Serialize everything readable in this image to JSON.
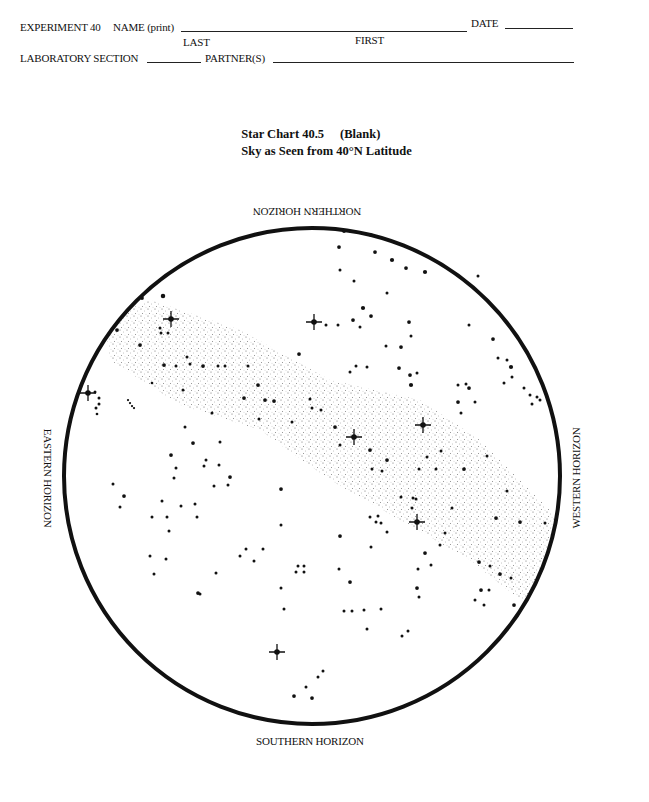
{
  "form": {
    "experiment_label": "EXPERIMENT 40",
    "name_label": "NAME (print)",
    "last_label": "LAST",
    "first_label": "FIRST",
    "date_label": "DATE",
    "section_label": "LABORATORY SECTION",
    "partners_label": "PARTNER(S)",
    "name_value": "",
    "date_value": "",
    "section_value": "",
    "partners_value": ""
  },
  "title": {
    "line1_a": "Star Chart 40.5",
    "line1_b": "(Blank)",
    "line2": "Sky as Seen from 40°N Latitude"
  },
  "horizons": {
    "north": "NORTHERN HORIZON",
    "south": "SOUTHERN HORIZON",
    "east": "EASTERN HORIZON",
    "west": "WESTERN HORIZON"
  },
  "chart": {
    "circle": {
      "cx": 312,
      "cy": 476,
      "r": 248,
      "stroke": "#111111",
      "stroke_width": 4
    },
    "milky_way": {
      "color": "#555555",
      "band": [
        [
          105,
          320
        ],
        [
          150,
          300
        ],
        [
          240,
          330
        ],
        [
          330,
          380
        ],
        [
          420,
          400
        ],
        [
          480,
          440
        ],
        [
          545,
          505
        ],
        [
          560,
          520
        ],
        [
          558,
          580
        ],
        [
          520,
          600
        ],
        [
          470,
          560
        ],
        [
          400,
          520
        ],
        [
          330,
          480
        ],
        [
          260,
          430
        ],
        [
          180,
          405
        ],
        [
          110,
          360
        ]
      ]
    },
    "bright_stars": [
      {
        "x": 171,
        "y": 319
      },
      {
        "x": 88,
        "y": 393
      },
      {
        "x": 314,
        "y": 322
      },
      {
        "x": 354,
        "y": 437
      },
      {
        "x": 423,
        "y": 425
      },
      {
        "x": 417,
        "y": 522
      },
      {
        "x": 277,
        "y": 652
      }
    ],
    "stars": [
      {
        "x": 163,
        "y": 296,
        "s": 3
      },
      {
        "x": 142,
        "y": 298,
        "s": 2.5
      },
      {
        "x": 117,
        "y": 330,
        "s": 2.5
      },
      {
        "x": 160,
        "y": 328,
        "s": 2
      },
      {
        "x": 168,
        "y": 333,
        "s": 2
      },
      {
        "x": 161,
        "y": 333,
        "s": 2
      },
      {
        "x": 140,
        "y": 345,
        "s": 2.5
      },
      {
        "x": 164,
        "y": 365,
        "s": 2.5
      },
      {
        "x": 176,
        "y": 366,
        "s": 2
      },
      {
        "x": 190,
        "y": 364,
        "s": 2
      },
      {
        "x": 203,
        "y": 366,
        "s": 2.5
      },
      {
        "x": 218,
        "y": 366,
        "s": 2
      },
      {
        "x": 225,
        "y": 366,
        "s": 2
      },
      {
        "x": 248,
        "y": 366,
        "s": 2
      },
      {
        "x": 258,
        "y": 385,
        "s": 2.5
      },
      {
        "x": 265,
        "y": 400,
        "s": 2.5
      },
      {
        "x": 274,
        "y": 401,
        "s": 2.5
      },
      {
        "x": 183,
        "y": 390,
        "s": 2
      },
      {
        "x": 152,
        "y": 383,
        "s": 1.8
      },
      {
        "x": 187,
        "y": 357,
        "s": 2
      },
      {
        "x": 95,
        "y": 392,
        "s": 2
      },
      {
        "x": 99,
        "y": 398,
        "s": 2
      },
      {
        "x": 99,
        "y": 404,
        "s": 2
      },
      {
        "x": 96,
        "y": 408,
        "s": 2
      },
      {
        "x": 97,
        "y": 414,
        "s": 1.8
      },
      {
        "x": 344,
        "y": 231,
        "s": 2.5
      },
      {
        "x": 371,
        "y": 235,
        "s": 2.5
      },
      {
        "x": 339,
        "y": 247,
        "s": 2.5
      },
      {
        "x": 375,
        "y": 252,
        "s": 2.5
      },
      {
        "x": 392,
        "y": 260,
        "s": 2.8
      },
      {
        "x": 406,
        "y": 268,
        "s": 2.5
      },
      {
        "x": 425,
        "y": 272,
        "s": 2.8
      },
      {
        "x": 340,
        "y": 270,
        "s": 2
      },
      {
        "x": 354,
        "y": 281,
        "s": 2
      },
      {
        "x": 387,
        "y": 293,
        "s": 2
      },
      {
        "x": 363,
        "y": 308,
        "s": 2.8
      },
      {
        "x": 371,
        "y": 316,
        "s": 2.5
      },
      {
        "x": 353,
        "y": 320,
        "s": 2.5
      },
      {
        "x": 326,
        "y": 325,
        "s": 2
      },
      {
        "x": 338,
        "y": 325,
        "s": 2
      },
      {
        "x": 360,
        "y": 327,
        "s": 2
      },
      {
        "x": 409,
        "y": 322,
        "s": 2.5
      },
      {
        "x": 411,
        "y": 336,
        "s": 2
      },
      {
        "x": 401,
        "y": 347,
        "s": 2.5
      },
      {
        "x": 386,
        "y": 346,
        "s": 2
      },
      {
        "x": 356,
        "y": 366,
        "s": 2
      },
      {
        "x": 350,
        "y": 372,
        "s": 2
      },
      {
        "x": 367,
        "y": 367,
        "s": 2
      },
      {
        "x": 399,
        "y": 368,
        "s": 2.5
      },
      {
        "x": 410,
        "y": 375,
        "s": 2.5
      },
      {
        "x": 417,
        "y": 373,
        "s": 2
      },
      {
        "x": 411,
        "y": 385,
        "s": 2.8
      },
      {
        "x": 478,
        "y": 276,
        "s": 2
      },
      {
        "x": 469,
        "y": 325,
        "s": 2
      },
      {
        "x": 493,
        "y": 339,
        "s": 2.5
      },
      {
        "x": 498,
        "y": 358,
        "s": 2
      },
      {
        "x": 507,
        "y": 360,
        "s": 2
      },
      {
        "x": 511,
        "y": 367,
        "s": 2.8
      },
      {
        "x": 512,
        "y": 377,
        "s": 2
      },
      {
        "x": 504,
        "y": 383,
        "s": 2
      },
      {
        "x": 466,
        "y": 384,
        "s": 2
      },
      {
        "x": 458,
        "y": 385,
        "s": 2
      },
      {
        "x": 469,
        "y": 388,
        "s": 2.5
      },
      {
        "x": 475,
        "y": 402,
        "s": 2
      },
      {
        "x": 458,
        "y": 402,
        "s": 2.5
      },
      {
        "x": 524,
        "y": 388,
        "s": 2
      },
      {
        "x": 530,
        "y": 395,
        "s": 2
      },
      {
        "x": 537,
        "y": 397,
        "s": 2
      },
      {
        "x": 532,
        "y": 404,
        "s": 2
      },
      {
        "x": 540,
        "y": 400,
        "s": 2
      },
      {
        "x": 299,
        "y": 354,
        "s": 2.5
      },
      {
        "x": 310,
        "y": 399,
        "s": 2
      },
      {
        "x": 312,
        "y": 408,
        "s": 2
      },
      {
        "x": 321,
        "y": 410,
        "s": 2
      },
      {
        "x": 244,
        "y": 398,
        "s": 2.5
      },
      {
        "x": 292,
        "y": 422,
        "s": 2
      },
      {
        "x": 212,
        "y": 413,
        "s": 2
      },
      {
        "x": 185,
        "y": 427,
        "s": 2
      },
      {
        "x": 193,
        "y": 443,
        "s": 2.5
      },
      {
        "x": 220,
        "y": 442,
        "s": 2
      },
      {
        "x": 206,
        "y": 460,
        "s": 2
      },
      {
        "x": 204,
        "y": 466,
        "s": 2
      },
      {
        "x": 219,
        "y": 465,
        "s": 2
      },
      {
        "x": 230,
        "y": 477,
        "s": 2.5
      },
      {
        "x": 228,
        "y": 485,
        "s": 2
      },
      {
        "x": 171,
        "y": 455,
        "s": 2.5
      },
      {
        "x": 176,
        "y": 468,
        "s": 2
      },
      {
        "x": 174,
        "y": 478,
        "s": 2
      },
      {
        "x": 214,
        "y": 486,
        "s": 2
      },
      {
        "x": 195,
        "y": 504,
        "s": 2
      },
      {
        "x": 181,
        "y": 506,
        "s": 2
      },
      {
        "x": 162,
        "y": 501,
        "s": 2
      },
      {
        "x": 113,
        "y": 484,
        "s": 2
      },
      {
        "x": 124,
        "y": 496,
        "s": 2.5
      },
      {
        "x": 120,
        "y": 507,
        "s": 2
      },
      {
        "x": 152,
        "y": 517,
        "s": 2
      },
      {
        "x": 167,
        "y": 517,
        "s": 2
      },
      {
        "x": 169,
        "y": 531,
        "s": 2
      },
      {
        "x": 197,
        "y": 517,
        "s": 2
      },
      {
        "x": 259,
        "y": 419,
        "s": 2
      },
      {
        "x": 281,
        "y": 489,
        "s": 2.5
      },
      {
        "x": 335,
        "y": 427,
        "s": 2.5
      },
      {
        "x": 340,
        "y": 445,
        "s": 2
      },
      {
        "x": 370,
        "y": 450,
        "s": 2.5
      },
      {
        "x": 387,
        "y": 460,
        "s": 2.5
      },
      {
        "x": 372,
        "y": 469,
        "s": 2
      },
      {
        "x": 382,
        "y": 471,
        "s": 2
      },
      {
        "x": 419,
        "y": 469,
        "s": 2
      },
      {
        "x": 427,
        "y": 457,
        "s": 2
      },
      {
        "x": 436,
        "y": 469,
        "s": 2
      },
      {
        "x": 413,
        "y": 498,
        "s": 2
      },
      {
        "x": 416,
        "y": 499,
        "s": 2
      },
      {
        "x": 401,
        "y": 497,
        "s": 2
      },
      {
        "x": 412,
        "y": 508,
        "s": 2
      },
      {
        "x": 370,
        "y": 517,
        "s": 2
      },
      {
        "x": 378,
        "y": 516,
        "s": 2
      },
      {
        "x": 376,
        "y": 522,
        "s": 2
      },
      {
        "x": 381,
        "y": 523,
        "s": 2
      },
      {
        "x": 387,
        "y": 532,
        "s": 2
      },
      {
        "x": 340,
        "y": 536,
        "s": 2.5
      },
      {
        "x": 371,
        "y": 547,
        "s": 2
      },
      {
        "x": 461,
        "y": 413,
        "s": 2
      },
      {
        "x": 441,
        "y": 451,
        "s": 2
      },
      {
        "x": 464,
        "y": 469,
        "s": 2.5
      },
      {
        "x": 487,
        "y": 456,
        "s": 2
      },
      {
        "x": 507,
        "y": 491,
        "s": 2
      },
      {
        "x": 496,
        "y": 518,
        "s": 2.5
      },
      {
        "x": 520,
        "y": 522,
        "s": 2.5
      },
      {
        "x": 452,
        "y": 508,
        "s": 2
      },
      {
        "x": 445,
        "y": 533,
        "s": 2
      },
      {
        "x": 440,
        "y": 545,
        "s": 2
      },
      {
        "x": 425,
        "y": 553,
        "s": 2.5
      },
      {
        "x": 479,
        "y": 562,
        "s": 2.5
      },
      {
        "x": 490,
        "y": 566,
        "s": 2
      },
      {
        "x": 500,
        "y": 574,
        "s": 2.5
      },
      {
        "x": 511,
        "y": 578,
        "s": 2
      },
      {
        "x": 481,
        "y": 590,
        "s": 2.5
      },
      {
        "x": 489,
        "y": 590,
        "s": 2
      },
      {
        "x": 475,
        "y": 600,
        "s": 2
      },
      {
        "x": 484,
        "y": 605,
        "s": 2
      },
      {
        "x": 514,
        "y": 605,
        "s": 2.5
      },
      {
        "x": 545,
        "y": 523,
        "s": 2
      },
      {
        "x": 150,
        "y": 556,
        "s": 2
      },
      {
        "x": 166,
        "y": 559,
        "s": 2
      },
      {
        "x": 154,
        "y": 574,
        "s": 2
      },
      {
        "x": 240,
        "y": 556,
        "s": 2
      },
      {
        "x": 246,
        "y": 549,
        "s": 2
      },
      {
        "x": 263,
        "y": 549,
        "s": 2
      },
      {
        "x": 254,
        "y": 561,
        "s": 2
      },
      {
        "x": 216,
        "y": 573,
        "s": 2
      },
      {
        "x": 198,
        "y": 593,
        "s": 2.5
      },
      {
        "x": 281,
        "y": 588,
        "s": 2
      },
      {
        "x": 298,
        "y": 566,
        "s": 2
      },
      {
        "x": 304,
        "y": 572,
        "s": 2
      },
      {
        "x": 296,
        "y": 572,
        "s": 2
      },
      {
        "x": 304,
        "y": 566,
        "s": 2
      },
      {
        "x": 284,
        "y": 609,
        "s": 2
      },
      {
        "x": 281,
        "y": 525,
        "s": 2
      },
      {
        "x": 339,
        "y": 569,
        "s": 2
      },
      {
        "x": 350,
        "y": 582,
        "s": 2.5
      },
      {
        "x": 344,
        "y": 611,
        "s": 2
      },
      {
        "x": 352,
        "y": 611,
        "s": 2
      },
      {
        "x": 364,
        "y": 610,
        "s": 2
      },
      {
        "x": 381,
        "y": 609,
        "s": 2
      },
      {
        "x": 367,
        "y": 629,
        "s": 2
      },
      {
        "x": 402,
        "y": 636,
        "s": 2
      },
      {
        "x": 408,
        "y": 631,
        "s": 2
      },
      {
        "x": 417,
        "y": 588,
        "s": 2.5
      },
      {
        "x": 419,
        "y": 597,
        "s": 2
      },
      {
        "x": 431,
        "y": 565,
        "s": 2
      },
      {
        "x": 418,
        "y": 569,
        "s": 2
      },
      {
        "x": 323,
        "y": 671,
        "s": 2
      },
      {
        "x": 318,
        "y": 677,
        "s": 2
      },
      {
        "x": 306,
        "y": 687,
        "s": 2
      },
      {
        "x": 294,
        "y": 696,
        "s": 2.5
      },
      {
        "x": 312,
        "y": 698,
        "s": 2.5
      },
      {
        "x": 200,
        "y": 594,
        "s": 2
      },
      {
        "x": 130,
        "y": 403,
        "s": 1.5
      },
      {
        "x": 132,
        "y": 406,
        "s": 1.5
      },
      {
        "x": 128,
        "y": 400,
        "s": 1.5
      },
      {
        "x": 134,
        "y": 408,
        "s": 1.5
      }
    ]
  }
}
